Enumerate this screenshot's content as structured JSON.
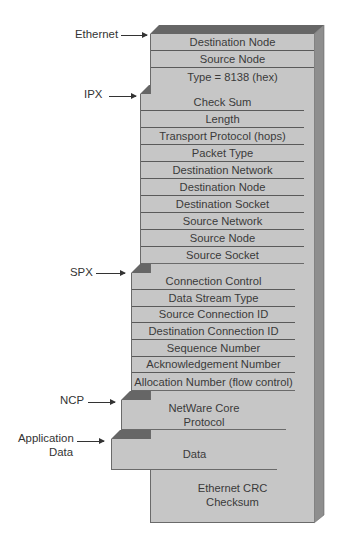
{
  "diagram": {
    "type": "protocol-frame-stack",
    "colors": {
      "front_face": "#c6c6c6",
      "top_bevel": "#666666",
      "side_face": "#8e8e8e",
      "divider": "#5a5a5a",
      "text": "#3a3a3a"
    },
    "layers": [
      {
        "name": "Ethernet",
        "label": "Ethernet",
        "fields": [
          "Destination Node",
          "Source Node",
          "Type = 8138 (hex)"
        ],
        "trailer": [
          "Ethernet CRC",
          "Checksum"
        ]
      },
      {
        "name": "IPX",
        "label": "IPX",
        "fields": [
          "Check Sum",
          "Length",
          "Transport Protocol (hops)",
          "Packet Type",
          "Destination Network",
          "Destination Node",
          "Destination Socket",
          "Source Network",
          "Source Node",
          "Source Socket"
        ]
      },
      {
        "name": "SPX",
        "label": "SPX",
        "fields": [
          "Connection Control",
          "Data Stream Type",
          "Source Connection ID",
          "Destination Connection ID",
          "Sequence Number",
          "Acknowledgement Number",
          "Allocation Number (flow control)"
        ]
      },
      {
        "name": "NCP",
        "label": "NCP",
        "content": [
          "NetWare Core",
          "Protocol"
        ]
      },
      {
        "name": "Application Data",
        "label_lines": [
          "Application",
          "Data"
        ],
        "content": "Data"
      }
    ]
  }
}
